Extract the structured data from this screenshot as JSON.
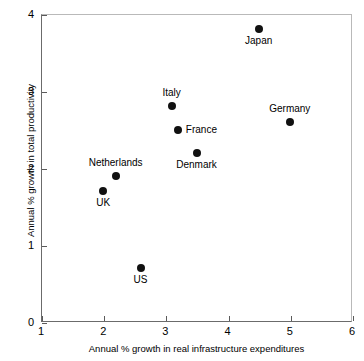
{
  "chart_data": {
    "type": "scatter",
    "title": "",
    "xlabel": "Annual % growth in real infrastructure expenditures",
    "ylabel": "Annual % growth in total productivity",
    "xlim": [
      1,
      6
    ],
    "ylim": [
      0,
      4
    ],
    "xticks": [
      "1",
      "2",
      "3",
      "4",
      "5",
      "6"
    ],
    "yticks": [
      "0",
      "1",
      "2",
      "3",
      "4"
    ],
    "grid": false,
    "legend": "none",
    "points": [
      {
        "label": "Japan",
        "x": 4.5,
        "y": 3.8,
        "label_pos": "below"
      },
      {
        "label": "Germany",
        "x": 5.0,
        "y": 2.6,
        "label_pos": "above"
      },
      {
        "label": "Italy",
        "x": 3.1,
        "y": 2.8,
        "label_pos": "above"
      },
      {
        "label": "France",
        "x": 3.2,
        "y": 2.5,
        "label_pos": "right"
      },
      {
        "label": "Denmark",
        "x": 3.5,
        "y": 2.2,
        "label_pos": "below"
      },
      {
        "label": "Netherlands",
        "x": 2.2,
        "y": 1.9,
        "label_pos": "above"
      },
      {
        "label": "UK",
        "x": 2.0,
        "y": 1.7,
        "label_pos": "below"
      },
      {
        "label": "US",
        "x": 2.6,
        "y": 0.7,
        "label_pos": "below"
      }
    ],
    "colors": {
      "marker": "#111111",
      "axis": "#6b6b6b",
      "frame_light": "#b9b9b9",
      "text": "#000000",
      "background": "#ffffff"
    }
  }
}
